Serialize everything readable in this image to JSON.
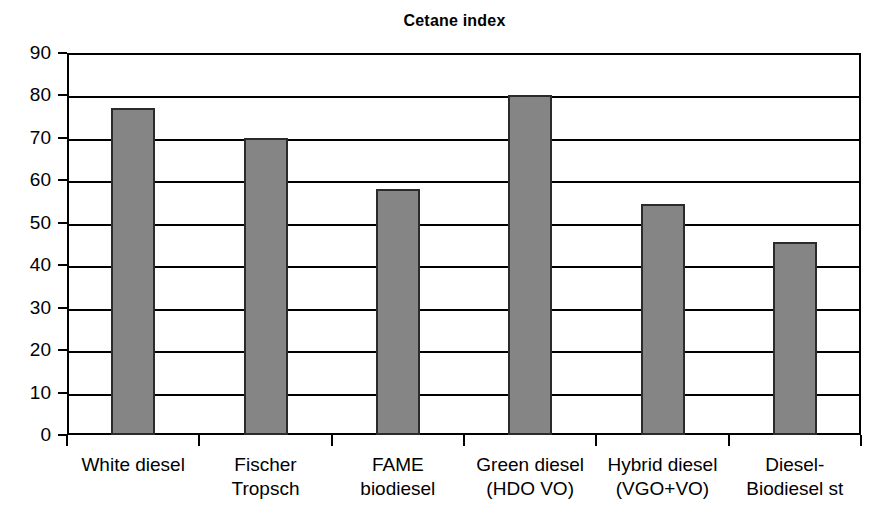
{
  "chart_data": {
    "type": "bar",
    "title": "Cetane index",
    "xlabel": "",
    "ylabel": "",
    "ylim": [
      0,
      90
    ],
    "ytick_step": 10,
    "grid": true,
    "legend": false,
    "categories": [
      "White diesel",
      "Fischer Tropsch",
      "FAME biodiesel",
      "Green diesel (HDO VO)",
      "Hybrid diesel (VGO+VO)",
      "Diesel-Biodiesel st"
    ],
    "category_lines": [
      [
        "White diesel",
        ""
      ],
      [
        "Fischer",
        "Tropsch"
      ],
      [
        "FAME",
        "biodiesel"
      ],
      [
        "Green diesel",
        "(HDO VO)"
      ],
      [
        "Hybrid diesel",
        "(VGO+VO)"
      ],
      [
        "Diesel-",
        "Biodiesel st"
      ]
    ],
    "values": [
      77,
      70,
      58,
      80,
      54.5,
      45.5
    ],
    "ytick_labels": [
      "90",
      "80",
      "70",
      "60",
      "50",
      "40",
      "30",
      "20",
      "10",
      "0"
    ],
    "ytick_values": [
      90,
      80,
      70,
      60,
      50,
      40,
      30,
      20,
      10,
      0
    ],
    "colors": {
      "bar_fill": "#858585",
      "bar_border": "#2b2b2b",
      "axis": "#000000",
      "grid": "#000000",
      "background": "#ffffff",
      "text": "#000000"
    }
  }
}
